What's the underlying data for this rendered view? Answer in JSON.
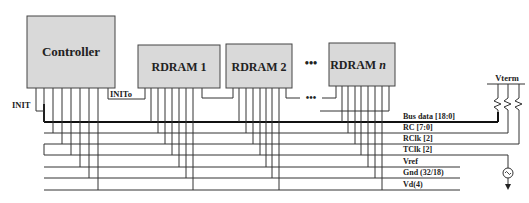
{
  "diagram": {
    "components": {
      "controller": {
        "label": "Controller"
      },
      "rdram1": {
        "label": "RDRAM 1"
      },
      "rdram2": {
        "label": "RDRAM 2"
      },
      "rdramn": {
        "label": "RDRAM ",
        "label_italic": "n"
      },
      "ellipsis_top": "•••",
      "ellipsis_chain": "•••"
    },
    "signals": {
      "init": "INIT",
      "inito": "INITo",
      "vterm": "Vterm"
    },
    "buses": [
      {
        "label": "Bus data [18:0]"
      },
      {
        "label": "RC [7:0]"
      },
      {
        "label": "RClk [2]"
      },
      {
        "label": "TClk [2]"
      },
      {
        "label": "Vref"
      },
      {
        "label": "Gnd (32/18)"
      },
      {
        "label": "Vd(4)"
      }
    ],
    "colors": {
      "box_fill": "#d9d9d9",
      "line": "#333333",
      "background": "#ffffff"
    }
  }
}
